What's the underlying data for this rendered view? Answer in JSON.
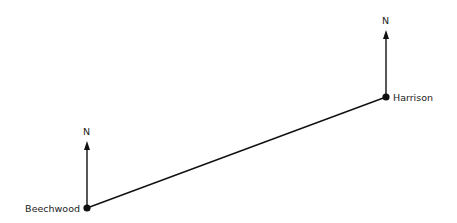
{
  "diagram": {
    "points": [
      {
        "name": "Beechwood",
        "x": 87,
        "y": 208,
        "north_label": "N"
      },
      {
        "name": "Harrison",
        "x": 386,
        "y": 97,
        "north_label": "N"
      }
    ],
    "colors": {
      "line": "#111111",
      "text": "#222222"
    }
  }
}
